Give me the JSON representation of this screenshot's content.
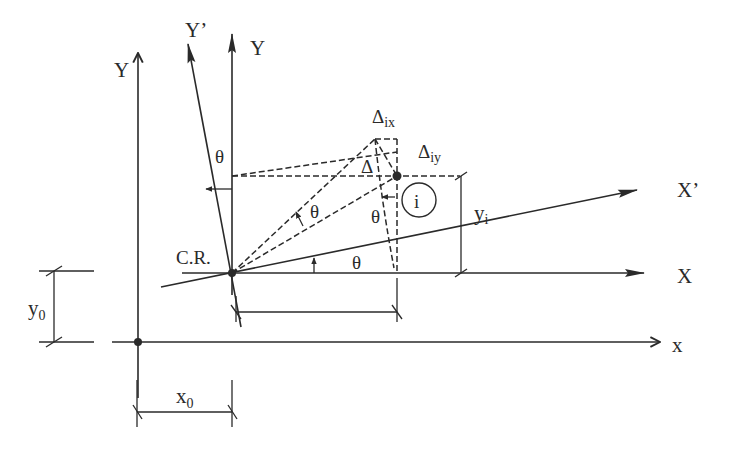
{
  "diagram": {
    "type": "geometry",
    "colors": {
      "ink": "#2a2a2a",
      "background": "#ffffff"
    },
    "labels": {
      "global_y_axis": "Y",
      "global_x_axis": "x",
      "local_y_axis": "Y",
      "rotated_y_axis": "Y’",
      "local_x_axis": "X",
      "rotated_x_axis": "X’",
      "center_of_rigidity": "C.R.",
      "point_i": "i",
      "delta_ix": "Δ",
      "delta_ix_sub": "ix",
      "delta_iy": "Δ",
      "delta_iy_sub": "iy",
      "delta": "Δ",
      "theta": "θ",
      "y_i": "y",
      "y_i_sub": "i",
      "x0": "x",
      "x0_sub": "0",
      "y0": "y",
      "y0_sub": "0"
    },
    "nodes": [
      {
        "id": "origin",
        "x": 138,
        "y": 342
      },
      {
        "id": "CR",
        "x": 232,
        "y": 273
      },
      {
        "id": "point_i",
        "x": 397,
        "y": 176
      },
      {
        "id": "point_i_displaced",
        "x": 375,
        "y": 139
      }
    ]
  }
}
